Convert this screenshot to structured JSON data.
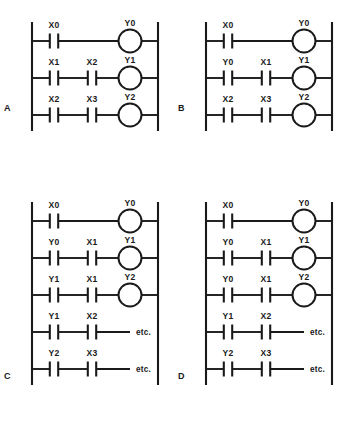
{
  "figure": {
    "panel_count": 4,
    "symbols": {
      "contact": "normally-open-contact",
      "coil": "output-coil",
      "rail": "power-rail"
    },
    "etc_label": "etc."
  },
  "panels": [
    {
      "id": "A",
      "label": "A",
      "rungs": [
        {
          "contacts": [
            "X0"
          ],
          "output": "Y0",
          "terminator": "coil"
        },
        {
          "contacts": [
            "X1",
            "X2"
          ],
          "output": "Y1",
          "terminator": "coil"
        },
        {
          "contacts": [
            "X2",
            "X3"
          ],
          "output": "Y2",
          "terminator": "coil"
        }
      ]
    },
    {
      "id": "B",
      "label": "B",
      "rungs": [
        {
          "contacts": [
            "X0"
          ],
          "output": "Y0",
          "terminator": "coil"
        },
        {
          "contacts": [
            "Y0",
            "X1"
          ],
          "output": "Y1",
          "terminator": "coil"
        },
        {
          "contacts": [
            "X2",
            "X3"
          ],
          "output": "Y2",
          "terminator": "coil"
        }
      ]
    },
    {
      "id": "C",
      "label": "C",
      "rungs": [
        {
          "contacts": [
            "X0"
          ],
          "output": "Y0",
          "terminator": "coil"
        },
        {
          "contacts": [
            "Y0",
            "X1"
          ],
          "output": "Y1",
          "terminator": "coil"
        },
        {
          "contacts": [
            "Y1",
            "X1"
          ],
          "output": "Y2",
          "terminator": "coil"
        },
        {
          "contacts": [
            "Y1",
            "X2"
          ],
          "output": "etc.",
          "terminator": "etc"
        },
        {
          "contacts": [
            "Y2",
            "X3"
          ],
          "output": "etc.",
          "terminator": "etc"
        }
      ]
    },
    {
      "id": "D",
      "label": "D",
      "rungs": [
        {
          "contacts": [
            "X0"
          ],
          "output": "Y0",
          "terminator": "coil"
        },
        {
          "contacts": [
            "Y0",
            "X1"
          ],
          "output": "Y1",
          "terminator": "coil"
        },
        {
          "contacts": [
            "Y0",
            "X1"
          ],
          "output": "Y2",
          "terminator": "coil"
        },
        {
          "contacts": [
            "Y1",
            "X2"
          ],
          "output": "etc.",
          "terminator": "etc"
        },
        {
          "contacts": [
            "Y2",
            "X3"
          ],
          "output": "etc.",
          "terminator": "etc"
        }
      ]
    }
  ]
}
